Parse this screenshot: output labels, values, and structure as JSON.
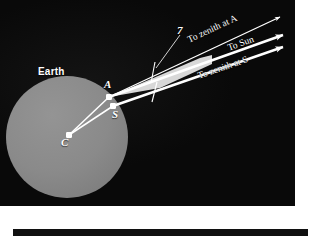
{
  "figure": {
    "caption_visible": false,
    "background_color": "#0b0b0b",
    "earth": {
      "label": "Earth",
      "fill_color": "#8a8a8a",
      "center_x": 80,
      "center_y": 150,
      "radius": 61
    },
    "points": [
      {
        "id": "C",
        "label": "C",
        "meaning": "center-of-earth",
        "x": 82,
        "y": 148
      },
      {
        "id": "A",
        "label": "A",
        "meaning": "alexandria-observation-point",
        "x": 122,
        "y": 110
      },
      {
        "id": "S",
        "label": "S",
        "meaning": "syene-observation-point",
        "x": 126,
        "y": 119
      }
    ],
    "angle_label": {
      "text": "7",
      "meaning": "zenith-angle-at-alexandria"
    },
    "rays": [
      {
        "id": "zenith-at-a",
        "label": "To zenith at A",
        "arrow": "small",
        "color": "#ffffff"
      },
      {
        "id": "to-sun",
        "label": "To Sun",
        "arrow": "large",
        "color": "#ffffff"
      },
      {
        "id": "zenith-at-s",
        "label": "To zenith at S",
        "arrow": "large",
        "color": "#ffffff"
      }
    ],
    "beam": {
      "id": "sunlight-wedge",
      "fill_color": "#d8d8d8",
      "description": "light-gray wedge between the two zenith rays"
    },
    "colors": {
      "panel": "#0b0b0b",
      "earth": "#8a8a8a",
      "line": "#ffffff",
      "wedge": "#d8d8d8",
      "page": "#ffffff"
    }
  }
}
